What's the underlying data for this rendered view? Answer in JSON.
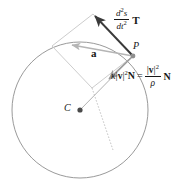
{
  "figure": {
    "background_color": "#ffffff",
    "colors": {
      "circle_stroke": "#9a9a9a",
      "parallelogram_stroke": "#bdbdbd",
      "acceleration_vector": "#b5b5b5",
      "tangential_vector": "#3a3a3a",
      "normal_vector": "#9a9a9a",
      "radius_line": "#a8a8a8",
      "point_fill": "#5c5c5c",
      "text": "#171717"
    },
    "geometry": {
      "circle": {
        "cx": 80,
        "cy": 110,
        "r": 68
      },
      "point_P": {
        "x": 133,
        "y": 56
      },
      "point_C": {
        "x": 80,
        "y": 110
      },
      "parallelogram_vertices": [
        {
          "x": 133,
          "y": 56
        },
        {
          "x": 93,
          "y": 14
        },
        {
          "x": 52,
          "y": 46
        },
        {
          "x": 92,
          "y": 88
        }
      ],
      "tangential_tip": {
        "x": 93,
        "y": 14
      },
      "normal_tip": {
        "x": 107,
        "y": 77
      },
      "a_tip": {
        "x": 70,
        "y": 44
      },
      "radius_extension_end": {
        "x": 113,
        "y": 148
      }
    }
  },
  "labels": {
    "tangential": {
      "numerator": "d",
      "numerator_sup": "2",
      "numerator_var": "s",
      "denominator": "dt",
      "denominator_sup": "2",
      "vector": "T",
      "full_text": "d²s/dt² T"
    },
    "normal": {
      "kappa": "κ",
      "open_bar": "|",
      "v": "v",
      "close_bar": "|",
      "exponent": "2",
      "vector_N": "N",
      "equals": "=",
      "frac_num_open_bar": "|",
      "frac_num_v": "v",
      "frac_num_close_bar": "|",
      "frac_num_exp": "2",
      "frac_den_rho": "ρ",
      "vector_N_after": "N",
      "full_text": "κ|v|²N = |v|²/ρ N"
    },
    "acceleration": "a",
    "point_p": "P",
    "point_c": "C"
  }
}
